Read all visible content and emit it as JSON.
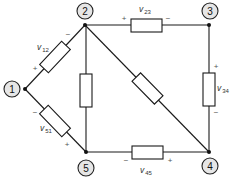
{
  "diagram": {
    "type": "circuit",
    "nodes": [
      {
        "id": "1",
        "label": "1"
      },
      {
        "id": "2",
        "label": "2"
      },
      {
        "id": "3",
        "label": "3"
      },
      {
        "id": "4",
        "label": "4"
      },
      {
        "id": "5",
        "label": "5"
      }
    ],
    "branches": [
      {
        "id": "v12",
        "from": "1",
        "to": "2",
        "label_main": "v",
        "label_sub": "12",
        "plus": "+",
        "minus": "−"
      },
      {
        "id": "v23",
        "from": "2",
        "to": "3",
        "label_main": "v",
        "label_sub": "23",
        "plus": "+",
        "minus": "−"
      },
      {
        "id": "v34",
        "from": "3",
        "to": "4",
        "label_main": "v",
        "label_sub": "34",
        "plus": "+",
        "minus": "−"
      },
      {
        "id": "v45",
        "from": "4",
        "to": "5",
        "label_main": "v",
        "label_sub": "45",
        "plus": "+",
        "minus": "−"
      },
      {
        "id": "v51",
        "from": "5",
        "to": "1",
        "label_main": "v",
        "label_sub": "51",
        "plus": "+",
        "minus": "−"
      },
      {
        "id": "b25",
        "from": "2",
        "to": "5"
      },
      {
        "id": "b24",
        "from": "2",
        "to": "4"
      }
    ]
  }
}
